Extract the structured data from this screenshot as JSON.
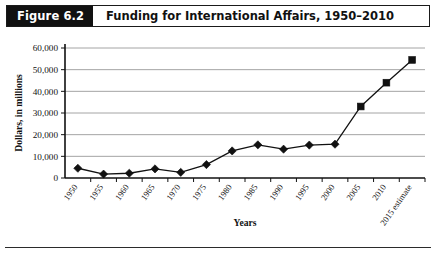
{
  "figure": {
    "number_label": "Figure 6.2",
    "title": "Funding for International Affairs, 1950–2010"
  },
  "chart_data": {
    "type": "line",
    "title": "Funding for International Affairs, 1950–2010",
    "xlabel": "Years",
    "ylabel": "Dollars, in millions",
    "categories": [
      "1950",
      "1955",
      "1960",
      "1965",
      "1970",
      "1975",
      "1980",
      "1985",
      "1990",
      "1995",
      "2000",
      "2005",
      "2010",
      "2015 estimate"
    ],
    "values": [
      4500,
      1800,
      2200,
      4200,
      2600,
      6200,
      12500,
      15300,
      13300,
      15200,
      15600,
      33000,
      44000,
      54500
    ],
    "marker_shapes": [
      "diamond",
      "diamond",
      "diamond",
      "diamond",
      "diamond",
      "diamond",
      "diamond",
      "diamond",
      "diamond",
      "diamond",
      "diamond",
      "square",
      "square",
      "square"
    ],
    "ylim": [
      0,
      60000
    ],
    "ytick_labels": [
      "0",
      "10,000",
      "20,000",
      "30,000",
      "40,000",
      "50,000",
      "60,000"
    ],
    "ytick_values": [
      0,
      10000,
      20000,
      30000,
      40000,
      50000,
      60000
    ],
    "grid": true,
    "legend": "none",
    "series_color": "#111111",
    "grid_color": "#9a9a9a",
    "axis_color": "#111111"
  }
}
